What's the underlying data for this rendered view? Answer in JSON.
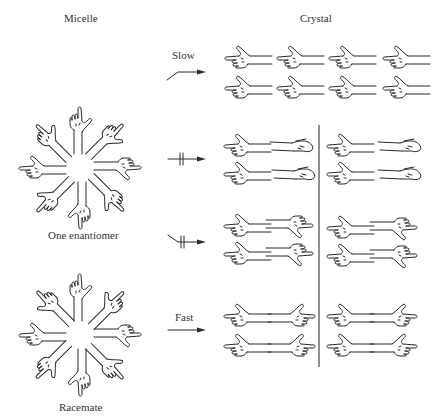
{
  "headers": {
    "micelle": "Micelle",
    "crystal": "Crystal"
  },
  "rosettes": [
    {
      "id": "one-enantiomer",
      "label": "One enantiomer",
      "cx": 80,
      "cy": 168,
      "hands": "homochiral"
    },
    {
      "id": "racemate",
      "label": "Racemate",
      "cx": 80,
      "cy": 335,
      "hands": "mixed-chirality"
    }
  ],
  "arrows": [
    {
      "id": "slow",
      "label": "Slow",
      "y": 72,
      "style": "bent-tail",
      "blocked": false
    },
    {
      "id": "blocked-1",
      "label": "",
      "y": 159,
      "style": "straight",
      "blocked": true
    },
    {
      "id": "blocked-2",
      "label": "",
      "y": 242,
      "style": "bent-tail",
      "blocked": true
    },
    {
      "id": "fast",
      "label": "Fast",
      "y": 328,
      "style": "straight",
      "blocked": false
    }
  ],
  "crystal_rows": [
    {
      "id": "row-homochiral",
      "arrangement": "all-left-pointing",
      "y": 52,
      "columns": 4,
      "divided": false
    },
    {
      "id": "row-blocked-1",
      "arrangement": "left-then-right-reversed-palms",
      "y": 145,
      "columns": 2,
      "divided": true
    },
    {
      "id": "row-blocked-2",
      "arrangement": "left-then-right-flipped",
      "y": 230,
      "columns": 2,
      "divided": true
    },
    {
      "id": "row-fast",
      "arrangement": "left-then-right-mirror-pairs",
      "y": 315,
      "columns": 2,
      "divided": true
    }
  ],
  "divider": {
    "x": 319,
    "y1": 125,
    "y2": 367
  }
}
